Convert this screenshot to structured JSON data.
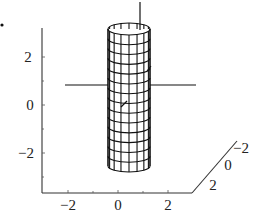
{
  "chart_data": {
    "type": "surface3d",
    "title": "",
    "surface": {
      "kind": "cylinder",
      "radius": 1,
      "z_range": [
        -3,
        3
      ],
      "mesh_rows": 14,
      "mesh_cols": 16
    },
    "axes": {
      "x": {
        "ticks": [
          "-2",
          "0",
          "2"
        ],
        "range": [
          -3,
          3
        ]
      },
      "y": {
        "ticks": [
          "-2",
          "0",
          "2"
        ],
        "range": [
          -3,
          3
        ]
      },
      "z": {
        "ticks": [
          "2",
          "0",
          "-2"
        ],
        "range": [
          -3,
          3
        ]
      }
    },
    "colors": {
      "line": "#111111",
      "background": "#ffffff"
    }
  },
  "labels": {
    "z_ticks": [
      "2",
      "0",
      "−2"
    ],
    "x_ticks": [
      "−2",
      "0",
      "2"
    ],
    "y_ticks": [
      "2",
      "0",
      "−2"
    ]
  }
}
